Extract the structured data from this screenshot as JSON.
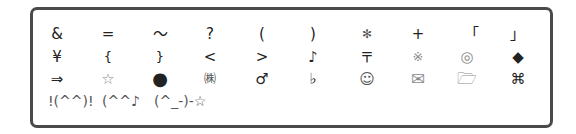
{
  "symbol_palette": {
    "rows": [
      {
        "cells": [
          {
            "name": "ampersand",
            "glyph": "&"
          },
          {
            "name": "equals",
            "glyph": "="
          },
          {
            "name": "wave-dash",
            "glyph": "〜"
          },
          {
            "name": "question-mark",
            "glyph": "?"
          },
          {
            "name": "open-paren",
            "glyph": "("
          },
          {
            "name": "close-paren",
            "glyph": ")"
          },
          {
            "name": "asterisk",
            "glyph": "✻"
          },
          {
            "name": "plus",
            "glyph": "+"
          },
          {
            "name": "corner-bracket-open",
            "glyph": "「"
          },
          {
            "name": "corner-bracket-close",
            "glyph": "」"
          }
        ]
      },
      {
        "cells": [
          {
            "name": "yen",
            "glyph": "¥"
          },
          {
            "name": "open-brace",
            "glyph": "{"
          },
          {
            "name": "close-brace",
            "glyph": "}"
          },
          {
            "name": "less-than",
            "glyph": "<"
          },
          {
            "name": "greater-than",
            "glyph": ">"
          },
          {
            "name": "music-note",
            "glyph": "♪"
          },
          {
            "name": "postal-mark",
            "glyph": "〒"
          },
          {
            "name": "reference-mark",
            "glyph": "※"
          },
          {
            "name": "bullseye",
            "glyph": "◎"
          },
          {
            "name": "black-diamond",
            "glyph": "◆"
          }
        ]
      },
      {
        "cells": [
          {
            "name": "double-right-arrow",
            "glyph": "⇒"
          },
          {
            "name": "white-star",
            "glyph": "☆"
          },
          {
            "name": "black-circle",
            "glyph": "●"
          },
          {
            "name": "kabushiki-gaisha",
            "glyph": "㈱"
          },
          {
            "name": "male-sign",
            "glyph": "♂"
          },
          {
            "name": "flat-sign",
            "glyph": "♭"
          },
          {
            "name": "smiley",
            "glyph": "☺"
          },
          {
            "name": "envelope",
            "glyph": "✉"
          },
          {
            "name": "folder",
            "glyph": "🗁"
          },
          {
            "name": "command-key",
            "glyph": "⌘"
          }
        ]
      }
    ],
    "kaomoji": [
      {
        "name": "kaomoji-cheer",
        "text": "!(^^)!"
      },
      {
        "name": "kaomoji-music",
        "text": "(^^♪"
      },
      {
        "name": "kaomoji-wink-star",
        "text": "(^_-)-☆"
      }
    ]
  }
}
